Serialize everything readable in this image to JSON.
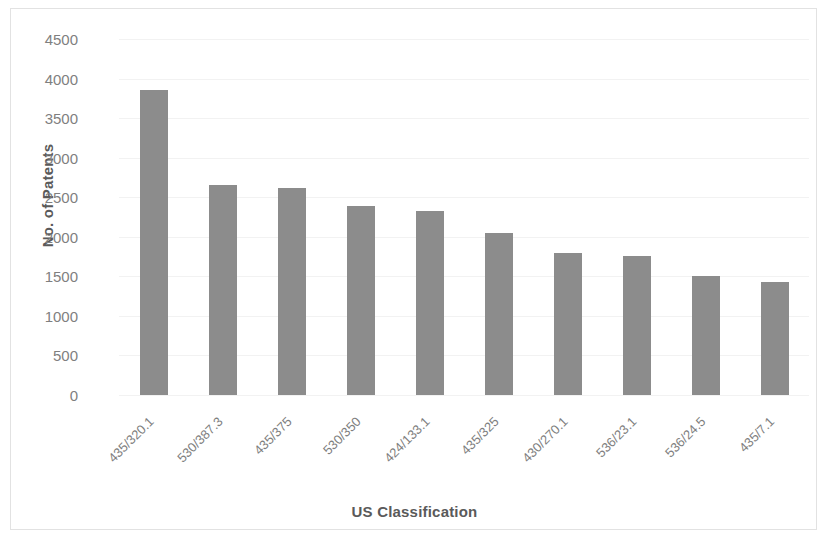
{
  "chart_data": {
    "type": "bar",
    "title": "",
    "xlabel": "US Classification",
    "ylabel": "No. of Patents",
    "categories": [
      "435/320.1",
      "530/387.3",
      "435/375",
      "530/350",
      "424/133.1",
      "435/325",
      "430/270.1",
      "536/23.1",
      "536/24.5",
      "435/7.1"
    ],
    "values": [
      3850,
      2660,
      2620,
      2390,
      2330,
      2050,
      1790,
      1760,
      1500,
      1430
    ],
    "ylim": [
      0,
      4500
    ],
    "y_ticks": [
      4500,
      4000,
      3500,
      3000,
      2500,
      2000,
      1500,
      1000,
      500,
      0
    ],
    "y_tick_labels": [
      "4500",
      "4000",
      "3500",
      "3000",
      "2500",
      "2000",
      "1500",
      "1000",
      "500",
      "0"
    ],
    "grid": true,
    "legend": "none",
    "bar_color": "#8c8c8c",
    "gridline_color": "#f2f2f2",
    "axis_text_color": "#7f7f7f",
    "title_text_color": "#5a5a5a",
    "border_color": "#e2e2e2"
  }
}
